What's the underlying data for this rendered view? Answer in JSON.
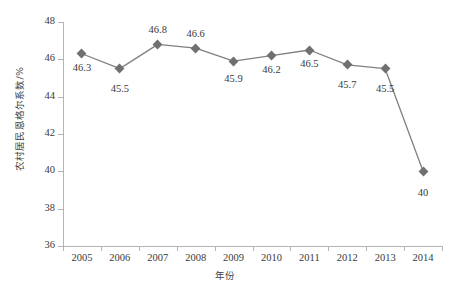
{
  "chart_data": {
    "type": "line",
    "title": "",
    "xlabel": "年份",
    "ylabel": "农村居民恩格尔系数/%",
    "categories": [
      "2005",
      "2006",
      "2007",
      "2008",
      "2009",
      "2010",
      "2011",
      "2012",
      "2013",
      "2014"
    ],
    "values": [
      46.3,
      45.5,
      46.8,
      46.6,
      45.9,
      46.2,
      46.5,
      45.7,
      45.5,
      40
    ],
    "point_labels": [
      "46.3",
      "45.5",
      "46.8",
      "46.6",
      "45.9",
      "46.2",
      "46.5",
      "45.7",
      "45.5",
      "40"
    ],
    "ylim": [
      36,
      48
    ],
    "ytick_step": 2,
    "yticks": [
      "48",
      "46",
      "44",
      "42",
      "40",
      "38",
      "36"
    ],
    "grid": false,
    "legend": "none",
    "series": [
      {
        "name": "农村居民恩格尔系数",
        "values": [
          46.3,
          45.5,
          46.8,
          46.6,
          45.9,
          46.2,
          46.5,
          45.7,
          45.5,
          40
        ],
        "line_color": "#808080",
        "marker_color": "#707070",
        "marker": "diamond"
      }
    ]
  },
  "axes": {
    "axis_color": "#b4b4b4",
    "label_color": "#3a3a3a"
  },
  "background": "#ffffff"
}
